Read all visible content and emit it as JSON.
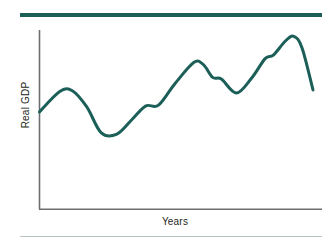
{
  "figure": {
    "name": "business-cycle-real-gdp-figure",
    "background_color": "#ffffff",
    "top_rule_color": "#1b5f58",
    "bottom_rule_color": "#b9c3c6"
  },
  "labels": {
    "y_axis": "Real GDP",
    "x_axis": "Years"
  },
  "chart_data": {
    "type": "line",
    "title": "",
    "subtitle": "",
    "xlabel": "Years",
    "ylabel": "Real GDP",
    "grid": false,
    "legend": "none",
    "axis": {
      "x_axis_visible": true,
      "y_axis_visible": true,
      "x_tick_labels": [],
      "y_tick_labels": [],
      "xlim": [
        0,
        100
      ],
      "ylim": [
        0,
        100
      ],
      "axis_color": "#6d6e71"
    },
    "series": [
      {
        "name": "Real GDP",
        "color": "#1b5f58",
        "line_width": 3,
        "smoothing": "spline",
        "points": [
          {
            "x": 0.0,
            "y": 54.2
          },
          {
            "x": 7.4,
            "y": 65.6
          },
          {
            "x": 12.0,
            "y": 66.1
          },
          {
            "x": 17.3,
            "y": 57.0
          },
          {
            "x": 22.6,
            "y": 42.5
          },
          {
            "x": 28.3,
            "y": 41.8
          },
          {
            "x": 34.0,
            "y": 50.3
          },
          {
            "x": 38.9,
            "y": 57.6
          },
          {
            "x": 43.5,
            "y": 58.0
          },
          {
            "x": 49.5,
            "y": 70.0
          },
          {
            "x": 56.5,
            "y": 82.0
          },
          {
            "x": 60.0,
            "y": 80.5
          },
          {
            "x": 63.3,
            "y": 73.5
          },
          {
            "x": 66.5,
            "y": 72.6
          },
          {
            "x": 72.0,
            "y": 64.8
          },
          {
            "x": 77.5,
            "y": 73.0
          },
          {
            "x": 82.5,
            "y": 84.0
          },
          {
            "x": 85.5,
            "y": 86.0
          },
          {
            "x": 90.0,
            "y": 94.0
          },
          {
            "x": 93.0,
            "y": 96.5
          },
          {
            "x": 96.0,
            "y": 90.0
          },
          {
            "x": 100.0,
            "y": 66.5
          }
        ],
        "annotations": [
          {
            "label": "peak",
            "x": 12.0,
            "y": 66.1
          },
          {
            "label": "trough",
            "x": 28.3,
            "y": 41.8
          },
          {
            "label": "peak",
            "x": 56.5,
            "y": 82.0
          },
          {
            "label": "trough",
            "x": 72.0,
            "y": 64.8
          },
          {
            "label": "peak",
            "x": 93.0,
            "y": 96.5
          }
        ]
      }
    ]
  }
}
